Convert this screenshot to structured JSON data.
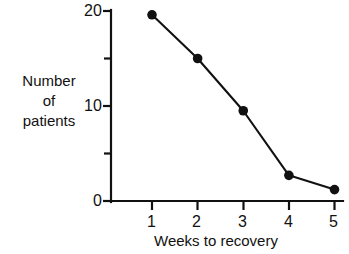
{
  "chart_data": {
    "type": "line",
    "title": "",
    "subtitle": "",
    "xlabel": "Weeks to recovery",
    "ylabel": "Number of patients",
    "ylabel_lines": [
      "Number",
      "of",
      "patients"
    ],
    "x": [
      1,
      2,
      3,
      4,
      5
    ],
    "values": [
      19.6,
      15.0,
      9.5,
      2.7,
      1.2
    ],
    "series": [
      {
        "name": "Number of patients",
        "x": [
          1,
          2,
          3,
          4,
          5
        ],
        "values": [
          19.6,
          15.0,
          9.5,
          2.7,
          1.2
        ]
      }
    ],
    "xtick_labels": [
      "1",
      "2",
      "3",
      "4",
      "5"
    ],
    "xtick_values": [
      1,
      2,
      3,
      4,
      5
    ],
    "ytick_labels": [
      "0",
      "10",
      "20"
    ],
    "ytick_values": [
      0,
      10,
      20
    ],
    "yminor_tick_values": [
      5,
      15
    ],
    "xlim": [
      0.55,
      5.0
    ],
    "ylim": [
      0,
      20
    ],
    "grid": false,
    "legend": false,
    "legend_position": "none",
    "marker": "filled-circle",
    "line_color": "#111111",
    "marker_color": "#111111",
    "background_color": "#ffffff"
  },
  "figure": {
    "ghost_header": ""
  }
}
